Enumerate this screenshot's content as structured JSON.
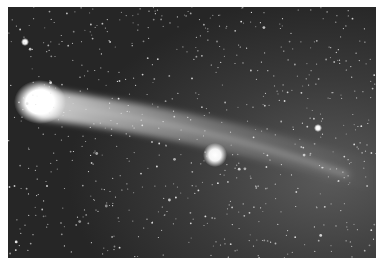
{
  "image": {
    "subject": "comet with tail against star field",
    "style": "grayscale astrophotograph",
    "border_color": "#ffffff",
    "sky_color": "#2e2e2e",
    "features": [
      {
        "name": "comet-nucleus",
        "cx": 32,
        "cy": 95,
        "r": 17
      },
      {
        "name": "bright-star",
        "cx": 207,
        "cy": 148,
        "r": 9
      },
      {
        "name": "star-top-left",
        "cx": 17,
        "cy": 35,
        "r": 3
      },
      {
        "name": "star-right",
        "cx": 310,
        "cy": 121,
        "r": 3
      }
    ]
  }
}
